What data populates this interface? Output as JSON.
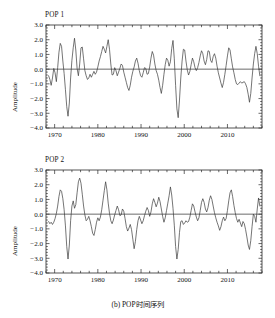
{
  "figure": {
    "caption": "(b) POP时间序列",
    "background_color": "#ffffff",
    "line_color": "#3a3a3a",
    "axis_color": "#2a2a2a"
  },
  "panels": [
    {
      "id": "pop1",
      "title": "POP 1",
      "ylabel": "Amplitude"
    },
    {
      "id": "pop2",
      "title": "POP 2",
      "ylabel": "Amplitude"
    }
  ],
  "chart_data": [
    {
      "type": "line",
      "title": "POP 1",
      "xlabel": "",
      "ylabel": "Amplitude",
      "xlim": [
        1968,
        2018
      ],
      "ylim": [
        -4.0,
        3.0
      ],
      "xticks": [
        1970,
        1980,
        1990,
        2000,
        2010
      ],
      "xticklabels": [
        "1970",
        "1980",
        "1990",
        "2000",
        "2010"
      ],
      "yticks": [
        -4.0,
        -3.0,
        -2.0,
        -1.0,
        0.0,
        1.0,
        2.0,
        3.0
      ],
      "yticklabels": [
        "-4.0",
        "-3.0",
        "-2.0",
        "-1.0",
        "0.0",
        "1.0",
        "2.0",
        "3.0"
      ],
      "grid": false,
      "legend": null,
      "zero_line": 0.0,
      "x": [
        1968.6,
        1968.9,
        1969.2,
        1969.5,
        1969.8,
        1970.1,
        1970.4,
        1970.7,
        1971.0,
        1971.3,
        1971.6,
        1971.9,
        1972.2,
        1972.5,
        1972.8,
        1973.1,
        1973.4,
        1973.7,
        1974.0,
        1974.3,
        1974.6,
        1974.9,
        1975.2,
        1975.5,
        1975.8,
        1976.1,
        1976.4,
        1976.7,
        1977.0,
        1977.3,
        1977.6,
        1977.9,
        1978.2,
        1978.5,
        1978.8,
        1979.1,
        1979.4,
        1979.7,
        1980.0,
        1980.3,
        1980.6,
        1980.9,
        1981.2,
        1981.5,
        1981.8,
        1982.1,
        1982.4,
        1982.7,
        1983.0,
        1983.3,
        1983.6,
        1983.9,
        1984.2,
        1984.5,
        1984.8,
        1985.1,
        1985.4,
        1985.7,
        1986.0,
        1986.3,
        1986.6,
        1986.9,
        1987.2,
        1987.5,
        1987.8,
        1988.1,
        1988.4,
        1988.7,
        1989.0,
        1989.3,
        1989.6,
        1989.9,
        1990.2,
        1990.5,
        1990.8,
        1991.1,
        1991.4,
        1991.7,
        1992.0,
        1992.3,
        1992.6,
        1992.9,
        1993.2,
        1993.5,
        1993.8,
        1994.1,
        1994.4,
        1994.7,
        1995.0,
        1995.3,
        1995.6,
        1995.9,
        1996.2,
        1996.5,
        1996.8,
        1997.1,
        1997.4,
        1997.7,
        1998.0,
        1998.3,
        1998.6,
        1998.9,
        1999.2,
        1999.5,
        1999.8,
        2000.1,
        2000.4,
        2000.7,
        2001.0,
        2001.3,
        2001.6,
        2001.9,
        2002.2,
        2002.5,
        2002.8,
        2003.1,
        2003.4,
        2003.7,
        2004.0,
        2004.3,
        2004.6,
        2004.9,
        2005.2,
        2005.5,
        2005.8,
        2006.1,
        2006.4,
        2006.7,
        2007.0,
        2007.3,
        2007.6,
        2007.9,
        2008.2,
        2008.5,
        2008.8,
        2009.1,
        2009.4,
        2009.7,
        2010.0,
        2010.3,
        2010.6,
        2010.9,
        2011.2,
        2011.5,
        2011.8,
        2012.1,
        2012.4,
        2012.7,
        2013.0,
        2013.3,
        2013.6,
        2013.9,
        2014.2,
        2014.5,
        2014.8,
        2015.1,
        2015.4,
        2015.7,
        2016.0,
        2016.3,
        2016.6,
        2016.9,
        2017.2,
        2017.5
      ],
      "values": [
        -0.45,
        -0.7,
        -1.1,
        -0.6,
        0.05,
        -0.25,
        -0.85,
        0.1,
        1.15,
        1.75,
        1.55,
        0.55,
        -0.3,
        -1.4,
        -2.55,
        -3.2,
        -2.3,
        -0.6,
        0.6,
        1.45,
        2.1,
        1.3,
        0.05,
        -0.45,
        0.35,
        1.45,
        1.5,
        0.7,
        -0.1,
        -0.45,
        -0.7,
        -0.6,
        -0.35,
        -0.55,
        -0.35,
        -0.15,
        -0.35,
        -0.2,
        0.15,
        0.55,
        0.85,
        1.2,
        1.55,
        1.35,
        1.1,
        1.55,
        2.0,
        1.35,
        0.35,
        -0.4,
        -0.35,
        0.1,
        -0.1,
        -0.45,
        -0.2,
        0.05,
        0.35,
        0.25,
        -0.2,
        -0.55,
        -0.9,
        -1.25,
        -1.45,
        -1.1,
        -0.55,
        -0.15,
        0.15,
        0.55,
        0.75,
        0.4,
        -0.1,
        -0.45,
        -0.55,
        -0.25,
        0.1,
        0.05,
        -0.35,
        -0.3,
        0.15,
        0.75,
        1.2,
        0.95,
        0.35,
        -0.1,
        -0.35,
        -0.75,
        -1.25,
        -1.65,
        -1.1,
        -0.35,
        0.3,
        0.75,
        0.6,
        0.2,
        0.5,
        1.4,
        1.95,
        0.7,
        -1.1,
        -2.7,
        -3.3,
        -2.1,
        -0.6,
        0.55,
        1.35,
        1.3,
        0.55,
        -0.05,
        -0.4,
        -0.15,
        0.3,
        0.75,
        0.5,
        0.1,
        -0.1,
        0.1,
        0.45,
        0.9,
        1.25,
        1.05,
        0.55,
        0.3,
        0.65,
        1.25,
        1.2,
        0.6,
        0.45,
        0.85,
        1.05,
        0.75,
        0.2,
        -0.25,
        -0.6,
        -0.95,
        -1.25,
        -0.9,
        -0.35,
        0.25,
        0.9,
        1.45,
        1.3,
        0.7,
        0.15,
        -0.25,
        -0.7,
        -1.0,
        -1.05,
        -0.95,
        -0.85,
        -0.95,
        -0.9,
        -0.85,
        -1.0,
        -1.25,
        -1.7,
        -2.25,
        -1.65,
        -0.6,
        0.35,
        1.05,
        1.55,
        1.05,
        0.2,
        -0.45
      ]
    },
    {
      "type": "line",
      "title": "POP 2",
      "xlabel": "",
      "ylabel": "Amplitude",
      "xlim": [
        1968,
        2018
      ],
      "ylim": [
        -4.0,
        3.0
      ],
      "xticks": [
        1970,
        1980,
        1990,
        2000,
        2010
      ],
      "xticklabels": [
        "1970",
        "1980",
        "1990",
        "2000",
        "2010"
      ],
      "yticks": [
        -4.0,
        -3.0,
        -2.0,
        -1.0,
        0.0,
        1.0,
        2.0,
        3.0
      ],
      "yticklabels": [
        "-4.0",
        "-3.0",
        "-2.0",
        "-1.0",
        "0.0",
        "1.0",
        "2.0",
        "3.0"
      ],
      "grid": false,
      "legend": null,
      "zero_line": 0.0,
      "x": [
        1968.6,
        1968.9,
        1969.2,
        1969.5,
        1969.8,
        1970.1,
        1970.4,
        1970.7,
        1971.0,
        1971.3,
        1971.6,
        1971.9,
        1972.2,
        1972.5,
        1972.8,
        1973.1,
        1973.4,
        1973.7,
        1974.0,
        1974.3,
        1974.6,
        1974.9,
        1975.2,
        1975.5,
        1975.8,
        1976.1,
        1976.4,
        1976.7,
        1977.0,
        1977.3,
        1977.6,
        1977.9,
        1978.2,
        1978.5,
        1978.8,
        1979.1,
        1979.4,
        1979.7,
        1980.0,
        1980.3,
        1980.6,
        1980.9,
        1981.2,
        1981.5,
        1981.8,
        1982.1,
        1982.4,
        1982.7,
        1983.0,
        1983.3,
        1983.6,
        1983.9,
        1984.2,
        1984.5,
        1984.8,
        1985.1,
        1985.4,
        1985.7,
        1986.0,
        1986.3,
        1986.6,
        1986.9,
        1987.2,
        1987.5,
        1987.8,
        1988.1,
        1988.4,
        1988.7,
        1989.0,
        1989.3,
        1989.6,
        1989.9,
        1990.2,
        1990.5,
        1990.8,
        1991.1,
        1991.4,
        1991.7,
        1992.0,
        1992.3,
        1992.6,
        1992.9,
        1993.2,
        1993.5,
        1993.8,
        1994.1,
        1994.4,
        1994.7,
        1995.0,
        1995.3,
        1995.6,
        1995.9,
        1996.2,
        1996.5,
        1996.8,
        1997.1,
        1997.4,
        1997.7,
        1998.0,
        1998.3,
        1998.6,
        1998.9,
        1999.2,
        1999.5,
        1999.8,
        2000.1,
        2000.4,
        2000.7,
        2001.0,
        2001.3,
        2001.6,
        2001.9,
        2002.2,
        2002.5,
        2002.8,
        2003.1,
        2003.4,
        2003.7,
        2004.0,
        2004.3,
        2004.6,
        2004.9,
        2005.2,
        2005.5,
        2005.8,
        2006.1,
        2006.4,
        2006.7,
        2007.0,
        2007.3,
        2007.6,
        2007.9,
        2008.2,
        2008.5,
        2008.8,
        2009.1,
        2009.4,
        2009.7,
        2010.0,
        2010.3,
        2010.6,
        2010.9,
        2011.2,
        2011.5,
        2011.8,
        2012.1,
        2012.4,
        2012.7,
        2013.0,
        2013.3,
        2013.6,
        2013.9,
        2014.2,
        2014.5,
        2014.8,
        2015.1,
        2015.4,
        2015.7,
        2016.0,
        2016.3,
        2016.6,
        2016.9,
        2017.2,
        2017.5
      ],
      "values": [
        -0.5,
        -0.65,
        -0.55,
        -0.7,
        -0.55,
        -0.3,
        0.05,
        0.55,
        1.2,
        1.65,
        1.55,
        1.05,
        0.3,
        -0.8,
        -2.2,
        -3.05,
        -2.1,
        -0.45,
        0.55,
        0.9,
        0.4,
        0.65,
        1.45,
        2.2,
        2.45,
        2.1,
        1.35,
        0.55,
        -0.05,
        -0.45,
        -0.35,
        -0.15,
        -0.45,
        -0.85,
        -1.3,
        -1.45,
        -1.05,
        -0.55,
        -0.25,
        -0.45,
        -0.2,
        0.3,
        0.95,
        1.6,
        2.2,
        1.65,
        0.75,
        0.05,
        -0.45,
        -0.65,
        -0.4,
        -0.05,
        0.25,
        0.55,
        0.3,
        -0.1,
        -0.05,
        0.35,
        0.2,
        -0.3,
        -0.85,
        -1.15,
        -0.95,
        -0.7,
        -1.05,
        -1.7,
        -2.35,
        -1.85,
        -1.05,
        -0.45,
        -0.15,
        -0.4,
        -0.65,
        -0.45,
        -0.1,
        0.2,
        0.45,
        0.25,
        -0.15,
        0.15,
        0.7,
        1.05,
        0.8,
        0.5,
        0.75,
        1.15,
        0.85,
        0.35,
        -0.15,
        -0.55,
        -0.25,
        0.25,
        0.75,
        1.25,
        1.85,
        1.3,
        0.4,
        -0.75,
        -2.2,
        -3.05,
        -2.4,
        -1.25,
        -0.5,
        -0.45,
        -0.7,
        -0.6,
        -0.45,
        -0.55,
        -0.5,
        -0.2,
        0.25,
        0.7,
        0.55,
        0.15,
        -0.2,
        -0.45,
        -0.25,
        0.25,
        0.8,
        1.05,
        0.8,
        0.35,
        0.15,
        0.45,
        0.95,
        1.25,
        1.0,
        0.55,
        0.1,
        -0.25,
        -0.55,
        -0.8,
        -1.1,
        -0.85,
        -0.45,
        -0.2,
        -0.45,
        -0.3,
        0.25,
        0.9,
        1.45,
        1.65,
        1.2,
        0.6,
        0.1,
        -0.3,
        -0.55,
        -0.35,
        -0.6,
        -0.85,
        -0.5,
        -0.65,
        -1.05,
        -1.55,
        -2.1,
        -2.4,
        -1.8,
        -0.85,
        0.0,
        -0.15,
        -0.55,
        0.35,
        1.1,
        0.55
      ]
    }
  ]
}
